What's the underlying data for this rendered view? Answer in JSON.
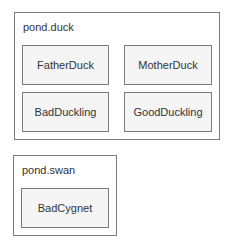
{
  "packages": [
    {
      "name": "pond.duck",
      "classes": [
        "FatherDuck",
        "MotherDuck",
        "BadDuckling",
        "GoodDuckling"
      ]
    },
    {
      "name": "pond.swan",
      "classes": [
        "BadCygnet"
      ]
    }
  ],
  "colors": {
    "border": "#7a7a7a",
    "class_fill": "#f5f5f5",
    "text": "#333333",
    "background": "#ffffff"
  }
}
